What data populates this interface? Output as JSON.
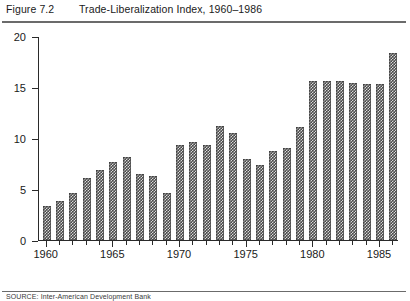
{
  "header": {
    "figure_number": "Figure 7.2",
    "title": "Trade-Liberalization Index, 1960–1986"
  },
  "footer": {
    "source": "SOURCE: Inter-American Development Bank"
  },
  "chart_data": {
    "type": "bar",
    "title": "Trade-Liberalization Index, 1960–1986",
    "xlabel": "",
    "ylabel": "",
    "ylim": [
      0,
      20
    ],
    "yticks": [
      0,
      5,
      10,
      15,
      20
    ],
    "ytick_labels": [
      "0",
      "5",
      "10",
      "15",
      "20"
    ],
    "xtick_labels": [
      "1960",
      "1965",
      "1970",
      "1975",
      "1980",
      "1985"
    ],
    "xticks": [
      1960,
      1965,
      1970,
      1975,
      1980,
      1985
    ],
    "grid": false,
    "legend": "none",
    "bar_color": "#4a4a4a",
    "bar_pattern": "crosshatch",
    "categories": [
      "1960",
      "1961",
      "1962",
      "1963",
      "1964",
      "1965",
      "1966",
      "1967",
      "1968",
      "1969",
      "1970",
      "1971",
      "1972",
      "1973",
      "1974",
      "1975",
      "1976",
      "1977",
      "1978",
      "1979",
      "1980",
      "1981",
      "1982",
      "1983",
      "1984",
      "1985",
      "1986"
    ],
    "values": [
      3.3,
      3.8,
      4.6,
      6.1,
      6.9,
      7.6,
      8.1,
      6.5,
      6.3,
      4.6,
      9.3,
      9.6,
      9.3,
      11.2,
      10.5,
      7.9,
      7.4,
      8.7,
      9.0,
      11.1,
      15.6,
      15.6,
      15.6,
      15.4,
      15.3,
      15.3,
      18.3
    ]
  }
}
